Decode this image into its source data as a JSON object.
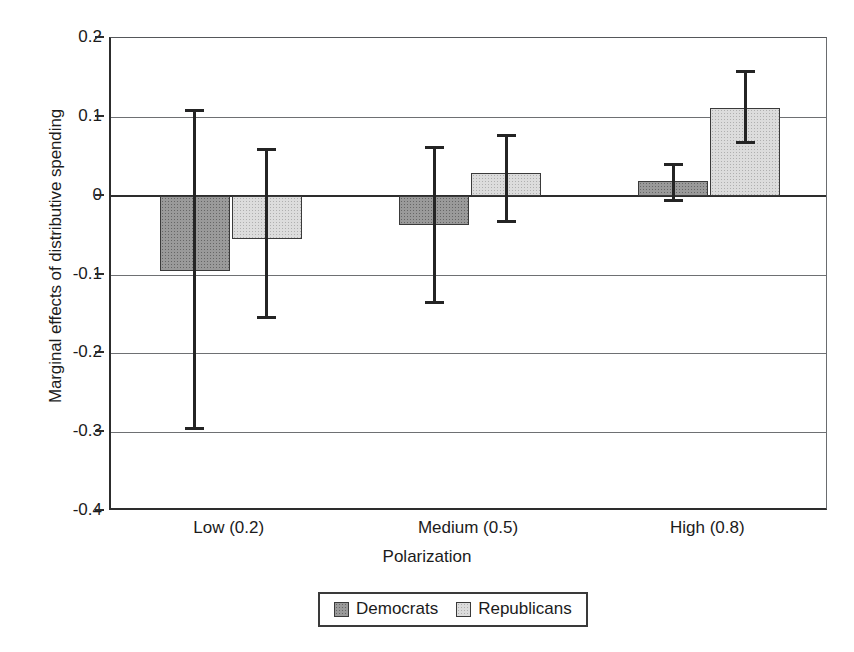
{
  "chart_data": {
    "type": "bar",
    "title": "",
    "xlabel": "Polarization",
    "ylabel": "Marginal effects of distributive spending",
    "categories": [
      "Low (0.2)",
      "Medium (0.5)",
      "High (0.8)"
    ],
    "ylim": [
      -0.4,
      0.2
    ],
    "yticks": [
      "0.2",
      "0.1",
      "0",
      "-0.1",
      "-0.2",
      "-0.3",
      "-0.4"
    ],
    "ytick_values": [
      0.2,
      0.1,
      0,
      -0.1,
      -0.2,
      -0.3,
      -0.4
    ],
    "grid": true,
    "legend_position": "bottom-center",
    "error_bars": true,
    "series": [
      {
        "name": "Democrats",
        "color": "#9a9a9a",
        "values": [
          -0.095,
          -0.037,
          0.018
        ],
        "error_upper": [
          0.11,
          0.063,
          0.042
        ],
        "error_lower": [
          -0.297,
          -0.138,
          -0.008
        ]
      },
      {
        "name": "Republicans",
        "color": "#dcdcdc",
        "values": [
          -0.055,
          0.029,
          0.111
        ],
        "error_upper": [
          0.06,
          0.078,
          0.159
        ],
        "error_lower": [
          -0.157,
          -0.035,
          0.066
        ]
      }
    ]
  },
  "legend": {
    "items": [
      {
        "label": "Democrats"
      },
      {
        "label": "Republicans"
      }
    ]
  }
}
